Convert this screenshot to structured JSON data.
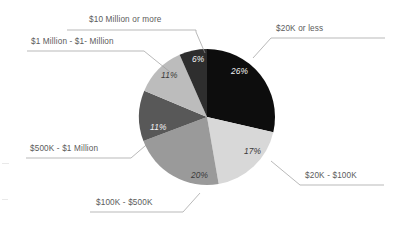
{
  "chart_data": {
    "type": "pie",
    "title": "",
    "subtitle": "",
    "xlabel": "",
    "ylabel": "",
    "legend_position": "callout-labels",
    "grid": false,
    "start_angle_deg": 0,
    "direction": "clockwise",
    "categories": [
      "$20K or less",
      "$20K - $100K",
      "$100K - $500K",
      "$500K - $1 Million",
      "$1 Million - $1- Million",
      "$10 Million or more"
    ],
    "values": [
      26,
      17,
      20,
      11,
      11,
      6
    ],
    "value_labels": [
      "26%",
      "17%",
      "20%",
      "11%",
      "11%",
      "6%"
    ],
    "colors": [
      "#0d0d0d",
      "#d8d8d8",
      "#9a9a9a",
      "#585858",
      "#bcbcbc",
      "#2e2e2e"
    ],
    "label_text_colors": [
      "#f2f2f2",
      "#3a3a3a",
      "#3a3a3a",
      "#f2f2f2",
      "#3a3a3a",
      "#f2f2f2"
    ]
  },
  "callouts": {
    "top": {
      "label": "$10 Million or more"
    },
    "upper_left": {
      "label": "$1 Million - $1- Million"
    },
    "mid_left": {
      "label": "$500K - $1 Million"
    },
    "bottom_left": {
      "label": "$100K - $500K"
    },
    "upper_right": {
      "label": "$20K or less"
    },
    "lower_right": {
      "label": "$20K - $100K"
    }
  },
  "slice_labels": {
    "s0": "26%",
    "s1": "17%",
    "s2": "20%",
    "s3": "11%",
    "s4": "11%",
    "s5": "6%"
  },
  "colors": {
    "background": "#ffffff",
    "leader_line": "#8c8c8c",
    "label_text": "#5b5b5b"
  }
}
